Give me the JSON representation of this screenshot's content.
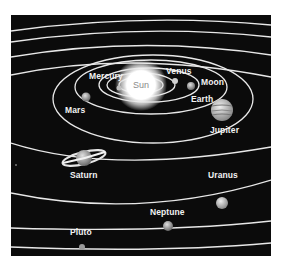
{
  "diagram": {
    "background": "#0b0b0b",
    "orbit_color": "#e8e8e8",
    "labels": {
      "sun": "Sun",
      "mercury": "Mercury",
      "venus": "Venus",
      "earth": "Earth",
      "moon": "Moon",
      "mars": "Mars",
      "jupiter": "Jupiter",
      "saturn": "Saturn",
      "uranus": "Uranus",
      "neptune": "Neptune",
      "pluto": "Pluto"
    }
  }
}
